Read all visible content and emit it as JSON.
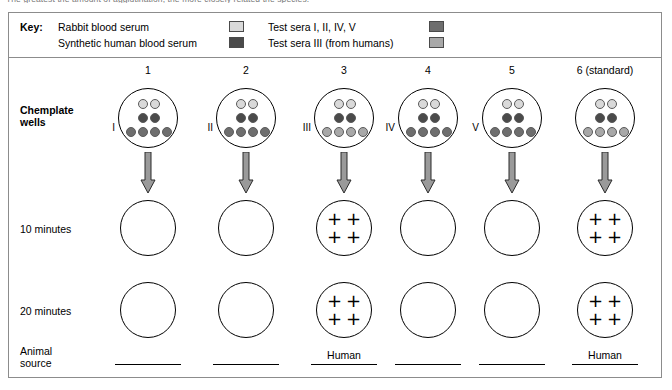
{
  "clipped_top_text": "The greatest the amount of agglutination, the more closely related the species.",
  "key": {
    "title": "Key:",
    "entries": [
      {
        "label": "Rabbit blood serum",
        "color": "#d9d9d9"
      },
      {
        "label": "Synthetic human blood serum",
        "color": "#4a4a4a"
      },
      {
        "label": "Test sera I, II, IV, V",
        "color": "#6e6e6e"
      },
      {
        "label": "Test sera III (from humans)",
        "color": "#a8a8a8"
      }
    ]
  },
  "row_labels": {
    "plate": "Chemplate\nwells",
    "ten_minutes": "10 minutes",
    "twenty_minutes": "20 minutes",
    "animal_source": "Animal\nsource"
  },
  "columns": [
    {
      "header": "1",
      "roman": "I",
      "top_dots": [
        "#d9d9d9",
        "#d9d9d9"
      ],
      "middle_dots": [
        "#4a4a4a",
        "#4a4a4a"
      ],
      "bottom_dots": [
        "#6e6e6e",
        "#6e6e6e",
        "#6e6e6e",
        "#6e6e6e"
      ],
      "result_10": [],
      "result_20": [],
      "source_answer": ""
    },
    {
      "header": "2",
      "roman": "II",
      "top_dots": [
        "#d9d9d9",
        "#d9d9d9"
      ],
      "middle_dots": [
        "#4a4a4a",
        "#4a4a4a"
      ],
      "bottom_dots": [
        "#6e6e6e",
        "#6e6e6e",
        "#6e6e6e",
        "#6e6e6e"
      ],
      "result_10": [],
      "result_20": [],
      "source_answer": ""
    },
    {
      "header": "3",
      "roman": "III",
      "top_dots": [
        "#d9d9d9",
        "#d9d9d9"
      ],
      "middle_dots": [
        "#4a4a4a",
        "#4a4a4a"
      ],
      "bottom_dots": [
        "#a8a8a8",
        "#a8a8a8",
        "#a8a8a8",
        "#a8a8a8"
      ],
      "result_10": [
        "+",
        "+",
        "+",
        "+"
      ],
      "result_20": [
        "+",
        "+",
        "+",
        "+"
      ],
      "source_answer": "Human"
    },
    {
      "header": "4",
      "roman": "IV",
      "top_dots": [
        "#d9d9d9",
        "#d9d9d9"
      ],
      "middle_dots": [
        "#4a4a4a",
        "#4a4a4a"
      ],
      "bottom_dots": [
        "#6e6e6e",
        "#6e6e6e",
        "#6e6e6e",
        "#6e6e6e"
      ],
      "result_10": [],
      "result_20": [],
      "source_answer": ""
    },
    {
      "header": "5",
      "roman": "V",
      "top_dots": [
        "#d9d9d9",
        "#d9d9d9"
      ],
      "middle_dots": [
        "#4a4a4a",
        "#4a4a4a"
      ],
      "bottom_dots": [
        "#6e6e6e",
        "#6e6e6e",
        "#6e6e6e",
        "#6e6e6e"
      ],
      "result_10": [],
      "result_20": [],
      "source_answer": ""
    },
    {
      "header": "6 (standard)",
      "roman": "",
      "top_dots": [
        "#d9d9d9",
        "#d9d9d9"
      ],
      "middle_dots": [
        "#4a4a4a",
        "#4a4a4a"
      ],
      "bottom_dots": [
        "#a8a8a8",
        "#a8a8a8",
        "#a8a8a8",
        "#a8a8a8"
      ],
      "result_10": [
        "+",
        "+",
        "+",
        "+"
      ],
      "result_20": [
        "+",
        "+",
        "+",
        "+"
      ],
      "source_answer": "Human"
    }
  ],
  "geometry": {
    "column_centers": [
      148,
      246,
      344,
      428,
      512,
      605
    ],
    "arrow_fill": "#9a9a9a",
    "arrow_stroke": "#2b2b2b"
  }
}
